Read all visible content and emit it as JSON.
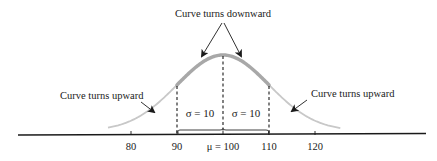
{
  "chart_data": {
    "type": "line",
    "title": "",
    "distribution": {
      "mean": 100,
      "sd": 10
    },
    "x_ticks": [
      80,
      90,
      100,
      110,
      120
    ],
    "x_tick_labels": [
      "80",
      "90",
      "μ = 100",
      "110",
      "120"
    ],
    "xlim": [
      70,
      130
    ],
    "grid": false,
    "legend": null,
    "annotations": {
      "top": "Curve turns downward",
      "left": "Curve turns upward",
      "right": "Curve turns upward",
      "sigma_left": "σ = 10",
      "sigma_right": "σ = 10"
    },
    "inflection_points": [
      90,
      110
    ],
    "highlighted_interval": [
      90,
      110
    ],
    "colors": {
      "curve_light": "#c4c4c4",
      "curve_highlight": "#a9a9a9",
      "axis": "#1a1a1a",
      "text": "#1a1a1a"
    }
  }
}
